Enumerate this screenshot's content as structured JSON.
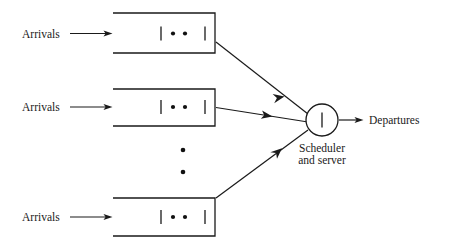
{
  "figure": {
    "type": "queueing-network-diagram",
    "background_color": "#ffffff",
    "line_color": "#1a1a1a",
    "text_color": "#1a1a1a"
  },
  "labels": {
    "arrivals_1": "Arrivals",
    "arrivals_2": "Arrivals",
    "arrivals_3": "Arrivals",
    "scheduler_line1": "Scheduler",
    "scheduler_line2": "and server",
    "departures": "Departures"
  },
  "queues": [
    {
      "id": "queue-1",
      "arrival_label": "Arrivals",
      "contents": [
        "bar",
        "dot",
        "dot",
        "bar"
      ],
      "x": 113,
      "y": 13,
      "width": 102,
      "height": 40
    },
    {
      "id": "queue-2",
      "arrival_label": "Arrivals",
      "contents": [
        "bar",
        "dot",
        "dot",
        "bar"
      ],
      "x": 113,
      "y": 89,
      "width": 102,
      "height": 37
    },
    {
      "id": "queue-3",
      "arrival_label": "Arrivals",
      "contents": [
        "bar",
        "dot",
        "dot",
        "bar"
      ],
      "x": 113,
      "y": 198,
      "width": 102,
      "height": 38
    }
  ],
  "ellipsis": {
    "orientation": "vertical",
    "dot_count": 2,
    "x": 183,
    "dots_y": [
      150,
      172
    ]
  },
  "server": {
    "label_line1": "Scheduler",
    "label_line2": "and server",
    "contents": [
      "bar"
    ],
    "center_x": 322,
    "center_y": 120,
    "radius": 16
  },
  "output": {
    "label": "Departures"
  },
  "connections": [
    {
      "from": "queue-1",
      "to": "server",
      "has_arrowhead": true
    },
    {
      "from": "queue-2",
      "to": "server",
      "has_arrowhead": true
    },
    {
      "from": "queue-3",
      "to": "server",
      "has_arrowhead": true
    },
    {
      "from": "server",
      "to": "departures",
      "has_arrowhead": true
    }
  ]
}
